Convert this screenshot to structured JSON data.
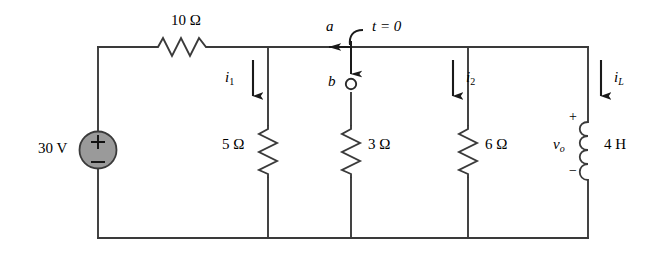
{
  "figure": {
    "type": "circuit-schematic",
    "background_color": "#ffffff",
    "wire_color": "#3a3a3a",
    "source_fill_color": "#9a9a9a"
  },
  "source": {
    "name": "dc-voltage-source",
    "label": "30 V",
    "plus_sign": "+",
    "minus_sign": "−"
  },
  "resistors": [
    {
      "name": "series-resistor",
      "label": "10 Ω",
      "orientation": "horizontal"
    },
    {
      "name": "resistor-5-ohm",
      "label": "5 Ω",
      "orientation": "vertical"
    },
    {
      "name": "resistor-3-ohm",
      "label": "3 Ω",
      "orientation": "vertical"
    },
    {
      "name": "resistor-6-ohm",
      "label": "6 Ω",
      "orientation": "vertical"
    }
  ],
  "inductor": {
    "name": "inductor",
    "label": "4 H",
    "voltage_label": "v",
    "voltage_subscript": "o",
    "plus_sign": "+",
    "minus_sign": "−"
  },
  "switch": {
    "name": "switch",
    "time_label": "t = 0",
    "terminal_a": "a",
    "terminal_b": "b"
  },
  "currents": [
    {
      "name": "current-i1",
      "symbol": "i",
      "subscript": "1",
      "direction": "down",
      "label_side": "left"
    },
    {
      "name": "current-i2",
      "symbol": "i",
      "subscript": "2",
      "direction": "down",
      "label_side": "right"
    },
    {
      "name": "current-iL",
      "symbol": "i",
      "subscript": "L",
      "direction": "down",
      "label_side": "right"
    }
  ]
}
